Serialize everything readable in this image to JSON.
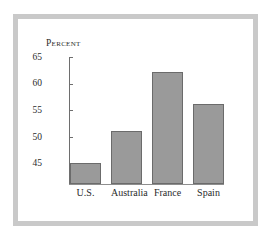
{
  "figure": {
    "title": "Percent",
    "frame_color": "#c9c9c9",
    "panel_color": "#ffffff",
    "bar_fill_color": "#9a9a9a",
    "bar_edge_color": "#6b6b6b",
    "axis_color": "#6e6e6e"
  },
  "chart_data": {
    "type": "bar",
    "title": "Percent",
    "xlabel": "",
    "ylabel": "Percent",
    "categories": [
      "U.S.",
      "Australia",
      "France",
      "Spain"
    ],
    "values": [
      45,
      51,
      62,
      56
    ],
    "ylim": [
      41,
      65
    ],
    "yticks": [
      45,
      50,
      55,
      60,
      65
    ],
    "ytick_labels": [
      "45",
      "50",
      "55",
      "60",
      "65"
    ],
    "grid": false,
    "legend": false,
    "series": [
      {
        "name": "Percent",
        "values": [
          45,
          51,
          62,
          56
        ]
      }
    ]
  }
}
